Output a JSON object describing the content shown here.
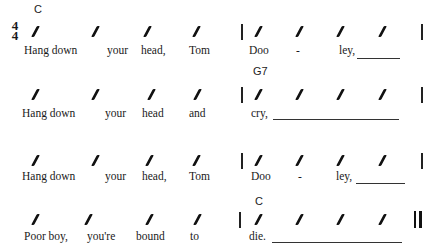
{
  "time_signature": {
    "top": "4",
    "bottom": "4"
  },
  "lines": [
    {
      "chords": [
        {
          "label": "C",
          "x": 35,
          "y": 4
        }
      ],
      "lyrics": [
        "Hang down",
        "your",
        "head,",
        "Tom",
        "Doo",
        "-",
        "ley,"
      ],
      "extender": true
    },
    {
      "chords": [
        {
          "label": "G7",
          "x": 255,
          "y": 65
        }
      ],
      "lyrics": [
        "Hang down",
        "your",
        "head",
        "and",
        "cry,"
      ],
      "extender": true
    },
    {
      "chords": [],
      "lyrics": [
        "Hang down",
        "your",
        "head,",
        "Tom",
        "Doo",
        "-",
        "ley,"
      ],
      "extender": true
    },
    {
      "chords": [
        {
          "label": "C",
          "x": 255,
          "y": 196
        }
      ],
      "lyrics": [
        "Poor boy,",
        "you're",
        "bound",
        "to",
        "die."
      ],
      "extender": true,
      "final_barline": true
    }
  ]
}
